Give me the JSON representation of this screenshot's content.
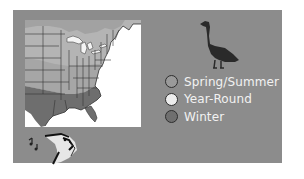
{
  "card": {
    "background": "#8c8c8c"
  },
  "map": {
    "region": "Eastern United States and southern Canada",
    "colors": {
      "spring_summer": "#b4b4b4",
      "year_round": "#9c9c9c",
      "winter": "#6e6e6e",
      "ocean": "#ffffff",
      "borders": "#333333"
    }
  },
  "icons": {
    "goose": "canada-goose-silhouette",
    "songbird": "singing-bird-icon",
    "music_notes": "music-notes-icon"
  },
  "legend": {
    "items": [
      {
        "label": "Spring/Summer",
        "color": "#9a9a9a"
      },
      {
        "label": "Year-Round",
        "color": "#ececec"
      },
      {
        "label": "Winter",
        "color": "#6f6f6f"
      }
    ]
  }
}
